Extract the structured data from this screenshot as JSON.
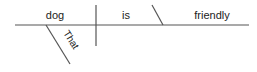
{
  "diagram": {
    "type": "sentence-diagram",
    "sentence": "That dog is friendly",
    "subject": "dog",
    "verb": "is",
    "predicate_adjective": "friendly",
    "modifier": "That",
    "line_color": "#555555",
    "text_color": "#222222"
  }
}
